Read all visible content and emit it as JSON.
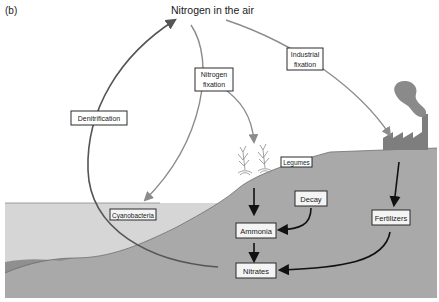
{
  "figure": {
    "panel_label": "(b)",
    "title": "Nitrogen in the air"
  },
  "labels": {
    "denitrification": "Denitrification",
    "nitrogen_fixation_line1": "Nitrogen",
    "nitrogen_fixation_line2": "fixation",
    "industrial_fixation_line1": "Industrial",
    "industrial_fixation_line2": "fixation",
    "legumes": "Legumes",
    "cyanobacteria": "Cyanobacteria",
    "decay": "Decay",
    "ammonia": "Ammonia",
    "nitrates": "Nitrates",
    "fertilizers": "Fertilizers"
  },
  "colors": {
    "sky": "#ffffff",
    "water": "#d6d6d6",
    "land": "#a9a9a9",
    "shore": "#8f8f8f",
    "factory": "#7e7e7e",
    "smoke": "#8a8a8a",
    "arrow_dark": "#111111",
    "arrow_grey": "#8c8c8c",
    "denitrification_arrow": "#555555"
  }
}
